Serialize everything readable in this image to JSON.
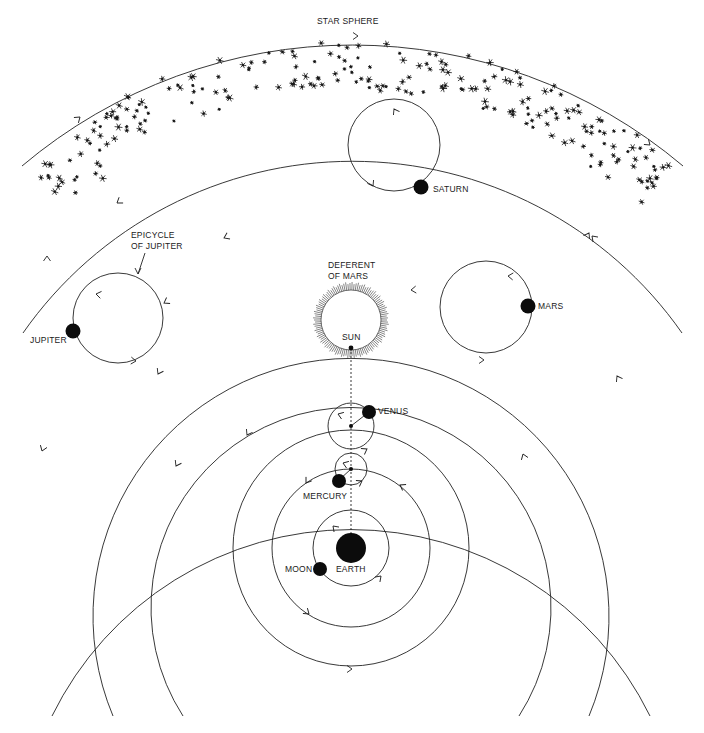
{
  "labels": {
    "star_sphere": "STAR SPHERE",
    "saturn": "SATURN",
    "epicycle_of_jupiter_1": "EPICYCLE",
    "epicycle_of_jupiter_2": "OF JUPITER",
    "jupiter": "JUPITER",
    "deferent_of_mars_1": "DEFERENT",
    "deferent_of_mars_2": "OF MARS",
    "mars": "MARS",
    "sun": "SUN",
    "venus": "VENUS",
    "mercury": "MERCURY",
    "moon": "MOON",
    "earth": "EARTH"
  },
  "colors": {
    "ink": "#0c0c0c",
    "line": "#222222",
    "background": "#ffffff"
  },
  "geometry": {
    "earth_center": [
      351,
      548
    ],
    "earth_radius": 15,
    "orbits": [
      {
        "name": "moon-orbit",
        "r": 38
      },
      {
        "name": "mercury-deferent",
        "r": 79
      },
      {
        "name": "venus-deferent",
        "r": 118
      },
      {
        "name": "sun-orbit",
        "r": 200
      },
      {
        "name": "mars-deferent",
        "r": 258
      },
      {
        "name": "jupiter-deferent",
        "r": 333
      },
      {
        "name": "saturn-deferent",
        "r": 402
      },
      {
        "name": "star-sphere",
        "r": 512
      }
    ],
    "epicycles": [
      {
        "name": "saturn",
        "center": [
          394,
          145
        ],
        "r": 46,
        "planet": [
          419,
          187
        ]
      },
      {
        "name": "jupiter",
        "center": [
          118,
          318
        ],
        "r": 45,
        "planet": [
          73,
          331
        ]
      },
      {
        "name": "mars",
        "center": [
          486,
          307
        ],
        "r": 46,
        "planet": [
          528,
          306
        ]
      },
      {
        "name": "venus",
        "center": [
          351,
          426
        ],
        "r": 23,
        "planet": [
          369,
          412
        ]
      },
      {
        "name": "mercury",
        "center": [
          351,
          469
        ],
        "r": 16,
        "planet": [
          339,
          480
        ]
      }
    ],
    "moon": [
      320,
      568
    ],
    "sun": [
      351,
      348
    ]
  }
}
